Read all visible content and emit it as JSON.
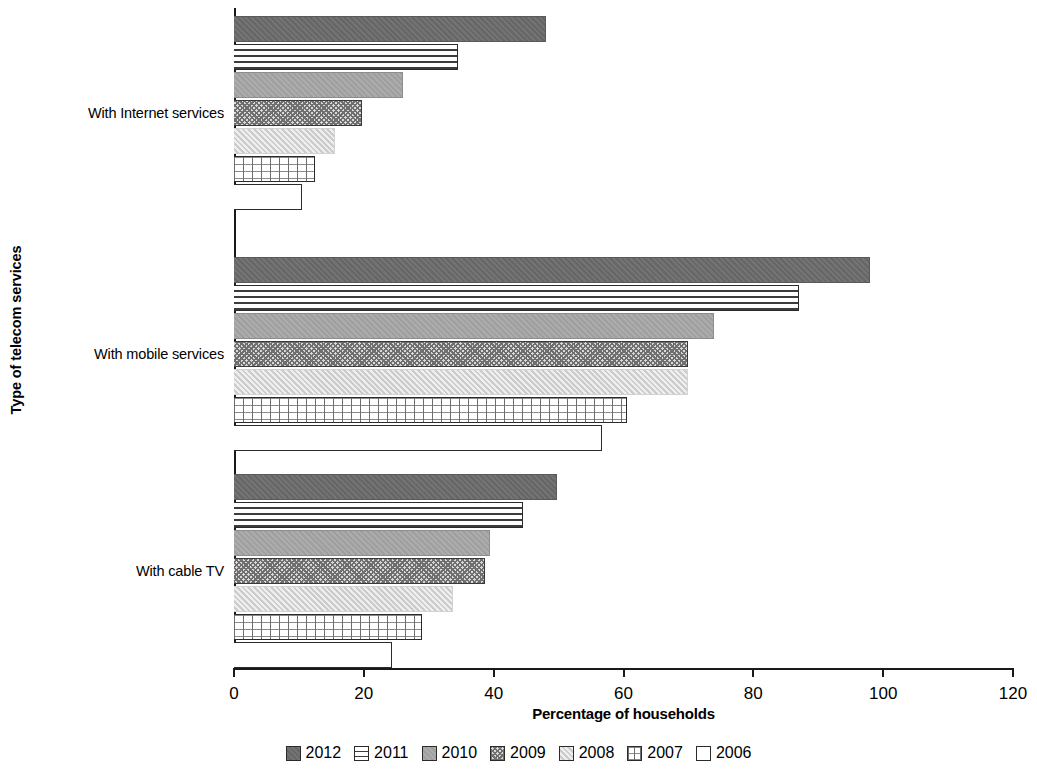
{
  "chart_data": {
    "type": "bar",
    "orientation": "horizontal",
    "title": "",
    "xlabel": "Percentage of households",
    "ylabel": "Type of telecom services",
    "categories": [
      "With Internet services",
      "With mobile services",
      "With cable TV"
    ],
    "xlim": [
      0,
      120
    ],
    "xticks": [
      0,
      20,
      40,
      60,
      80,
      100,
      120
    ],
    "xtick_labels": [
      "0",
      "20",
      "40",
      "60",
      "80",
      "100",
      "120"
    ],
    "grid": false,
    "legend_position": "bottom",
    "series": [
      {
        "name": "2012",
        "pattern": "solid-dark-gray",
        "color": "#6b6b6b",
        "values": [
          48.0,
          98.0,
          49.8
        ]
      },
      {
        "name": "2011",
        "pattern": "horizontal-lines",
        "color": "#ffffff",
        "values": [
          34.5,
          87.0,
          44.5
        ]
      },
      {
        "name": "2010",
        "pattern": "solid-medium-gray",
        "color": "#a5a5a5",
        "values": [
          26.0,
          74.0,
          39.4
        ]
      },
      {
        "name": "2009",
        "pattern": "cross-hatch",
        "color": "#d9d9d9",
        "values": [
          19.7,
          70.0,
          38.7
        ]
      },
      {
        "name": "2008",
        "pattern": "solid-light-gray",
        "color": "#dedede",
        "values": [
          15.6,
          70.0,
          33.7
        ]
      },
      {
        "name": "2007",
        "pattern": "grid",
        "color": "#ffffff",
        "values": [
          12.5,
          60.5,
          29.0
        ]
      },
      {
        "name": "2006",
        "pattern": "outline-white",
        "color": "#ffffff",
        "values": [
          10.5,
          56.7,
          24.3
        ]
      }
    ]
  },
  "axes": {
    "x_title": "Percentage of households",
    "y_title": "Type of telecom services",
    "x_ticks": [
      "0",
      "20",
      "40",
      "60",
      "80",
      "100",
      "120"
    ]
  },
  "groups": [
    {
      "label": "With Internet services"
    },
    {
      "label": "With mobile services"
    },
    {
      "label": "With cable TV"
    }
  ],
  "legend": [
    {
      "label": "2012"
    },
    {
      "label": "2011"
    },
    {
      "label": "2010"
    },
    {
      "label": "2009"
    },
    {
      "label": "2008"
    },
    {
      "label": "2007"
    },
    {
      "label": "2006"
    }
  ]
}
